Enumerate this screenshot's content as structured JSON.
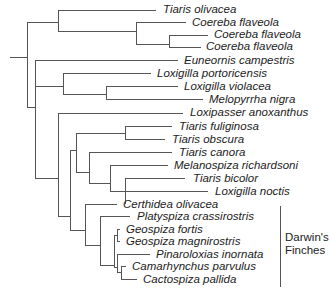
{
  "tree": {
    "line_color": "#555555",
    "taxa": [
      {
        "name": "Tiaris olivacea",
        "y": 9,
        "x": 163
      },
      {
        "name": "Coereba flaveola",
        "y": 22,
        "x": 192
      },
      {
        "name": "Coereba flaveola",
        "y": 34,
        "x": 214
      },
      {
        "name": "Coereba flaveola",
        "y": 46,
        "x": 206
      },
      {
        "name": "Euneornis campestris",
        "y": 60,
        "x": 184
      },
      {
        "name": "Loxigilla portoricensis",
        "y": 73,
        "x": 157
      },
      {
        "name": "Loxigilla violacea",
        "y": 86,
        "x": 184
      },
      {
        "name": "Melopyrrha nigra",
        "y": 99,
        "x": 209
      },
      {
        "name": "Loxipasser anoxanthus",
        "y": 112,
        "x": 190
      },
      {
        "name": "Tiaris fuliginosa",
        "y": 126,
        "x": 179
      },
      {
        "name": "Tiaris obscura",
        "y": 139,
        "x": 172
      },
      {
        "name": "Tiaris canora",
        "y": 152,
        "x": 179
      },
      {
        "name": "Melanospiza richardsoni",
        "y": 165,
        "x": 174
      },
      {
        "name": "Tiaris bicolor",
        "y": 178,
        "x": 193
      },
      {
        "name": "Loxigilla noctis",
        "y": 191,
        "x": 215
      },
      {
        "name": "Certhidea olivacea",
        "y": 204,
        "x": 123
      },
      {
        "name": "Platyspiza crassirostris",
        "y": 216,
        "x": 137
      },
      {
        "name": "Geospiza fortis",
        "y": 229,
        "x": 126
      },
      {
        "name": "Geospiza magnirostris",
        "y": 241,
        "x": 126
      },
      {
        "name": "Pinaroloxias inornata",
        "y": 254,
        "x": 156
      },
      {
        "name": "Camarhynchus parvulus",
        "y": 266,
        "x": 132
      },
      {
        "name": "Cactospiza pallida",
        "y": 279,
        "x": 143
      }
    ],
    "group": {
      "line1": "Darwin's",
      "line2": "Finches"
    }
  }
}
